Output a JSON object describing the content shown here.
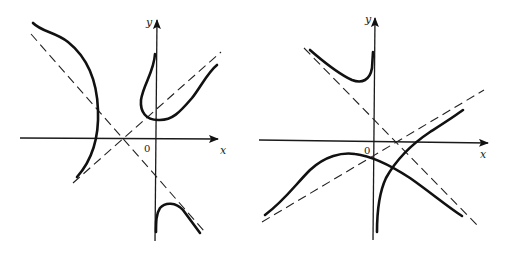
{
  "figures": [
    {
      "id": "left",
      "axis_labels": {
        "x": "x",
        "y": "y",
        "origin": "0"
      },
      "description": "Curve with two slant asymptotes crossing left of origin; three branches"
    },
    {
      "id": "right",
      "axis_labels": {
        "x": "x",
        "y": "y",
        "origin": "0"
      },
      "description": "Curve with two slant asymptotes crossing right of origin; three branches"
    }
  ],
  "colors": {
    "ink": "#111111",
    "background": "#ffffff"
  }
}
